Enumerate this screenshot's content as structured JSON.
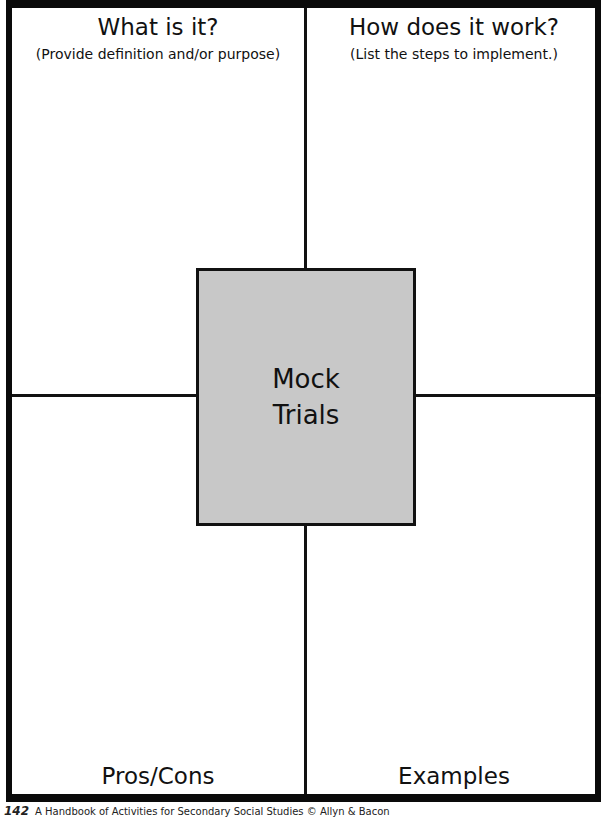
{
  "quadrants": {
    "top_left": {
      "title": "What is it?",
      "subtitle": "(Provide definition and/or purpose)"
    },
    "top_right": {
      "title": "How does it work?",
      "subtitle": "(List the steps to implement.)"
    },
    "bottom_left": {
      "title": "Pros/Cons"
    },
    "bottom_right": {
      "title": "Examples"
    }
  },
  "center": {
    "line1": "Mock",
    "line2": "Trials"
  },
  "footer": {
    "page_number": "142",
    "text": "A Handbook of Activities for Secondary Social Studies © Allyn & Bacon"
  }
}
